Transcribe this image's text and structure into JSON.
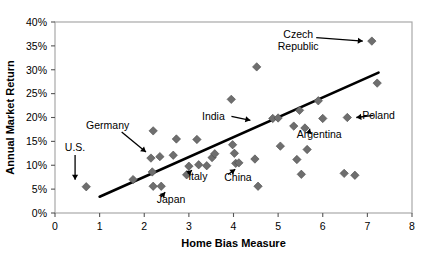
{
  "chart_data": {
    "type": "scatter",
    "title": "",
    "xlabel": "Home Bias Measure",
    "ylabel": "Annual Market Return",
    "xlim": [
      0,
      8
    ],
    "ylim": [
      0,
      40
    ],
    "xticks": [
      "0",
      "1",
      "2",
      "3",
      "4",
      "5",
      "6",
      "7",
      "8"
    ],
    "yticks": [
      "0%",
      "5%",
      "10%",
      "15%",
      "20%",
      "25%",
      "30%",
      "35%",
      "40%"
    ],
    "grid": false,
    "legend": "none",
    "marker": "diamond",
    "marker_color": "#6e6e6e",
    "trendline_color": "#000000",
    "points": [
      {
        "x": 0.7,
        "y": 5.5
      },
      {
        "x": 1.75,
        "y": 7.0
      },
      {
        "x": 2.15,
        "y": 11.5
      },
      {
        "x": 2.2,
        "y": 5.6
      },
      {
        "x": 2.18,
        "y": 8.6
      },
      {
        "x": 2.2,
        "y": 17.2
      },
      {
        "x": 2.35,
        "y": 11.8
      },
      {
        "x": 2.38,
        "y": 5.6
      },
      {
        "x": 2.65,
        "y": 12.1
      },
      {
        "x": 2.72,
        "y": 15.5
      },
      {
        "x": 2.95,
        "y": 8.0
      },
      {
        "x": 3.0,
        "y": 9.8
      },
      {
        "x": 3.18,
        "y": 15.4
      },
      {
        "x": 3.22,
        "y": 10.1
      },
      {
        "x": 3.4,
        "y": 9.9
      },
      {
        "x": 3.52,
        "y": 11.6
      },
      {
        "x": 3.58,
        "y": 12.4
      },
      {
        "x": 3.95,
        "y": 23.8
      },
      {
        "x": 3.98,
        "y": 14.3
      },
      {
        "x": 4.02,
        "y": 12.5
      },
      {
        "x": 4.05,
        "y": 10.4
      },
      {
        "x": 4.12,
        "y": 10.5
      },
      {
        "x": 4.48,
        "y": 11.3
      },
      {
        "x": 4.52,
        "y": 30.6
      },
      {
        "x": 4.55,
        "y": 5.6
      },
      {
        "x": 4.88,
        "y": 19.8
      },
      {
        "x": 5.0,
        "y": 19.9
      },
      {
        "x": 5.05,
        "y": 14.0
      },
      {
        "x": 5.35,
        "y": 18.2
      },
      {
        "x": 5.42,
        "y": 11.2
      },
      {
        "x": 5.48,
        "y": 21.5
      },
      {
        "x": 5.52,
        "y": 8.1
      },
      {
        "x": 5.6,
        "y": 17.8
      },
      {
        "x": 5.65,
        "y": 13.3
      },
      {
        "x": 5.9,
        "y": 23.5
      },
      {
        "x": 6.0,
        "y": 19.8
      },
      {
        "x": 6.48,
        "y": 8.3
      },
      {
        "x": 6.55,
        "y": 20.0
      },
      {
        "x": 6.72,
        "y": 7.9
      },
      {
        "x": 7.1,
        "y": 36.0
      },
      {
        "x": 7.22,
        "y": 27.2
      }
    ],
    "trendline": {
      "x1": 1.0,
      "y1": 3.4,
      "x2": 7.25,
      "y2": 29.4
    },
    "annotations": [
      {
        "label": "U.S.",
        "text_x": 0.45,
        "text_y": 13.0,
        "point_x": 0.7,
        "point_y": 5.5,
        "arrow": "down"
      },
      {
        "label": "Germany",
        "text_x": 1.18,
        "text_y": 17.6,
        "point_x": 2.15,
        "point_y": 11.5,
        "arrow": "diag-down-right"
      },
      {
        "label": "Japan",
        "text_x": 2.6,
        "text_y": 2.1,
        "point_x": 2.38,
        "point_y": 5.6,
        "arrow": "diag-up-left"
      },
      {
        "label": "Italy",
        "text_x": 3.2,
        "text_y": 7.0,
        "point_x": 2.98,
        "point_y": 10.2,
        "arrow": "diag-up-left"
      },
      {
        "label": "China",
        "text_x": 4.1,
        "text_y": 6.8,
        "point_x": 3.95,
        "point_y": 10.4,
        "arrow": "diag-up-left"
      },
      {
        "label": "India",
        "text_x": 3.55,
        "text_y": 19.5,
        "point_x": 4.58,
        "point_y": 19.4,
        "arrow": "right"
      },
      {
        "label": "Argentina",
        "text_x": 5.92,
        "text_y": 15.7,
        "point_x": 5.62,
        "point_y": 18.9,
        "arrow": "diag-up-left"
      },
      {
        "label": "Czech Republic",
        "text_x": 5.45,
        "text_y": 36.0,
        "point_x": 7.1,
        "point_y": 36.0,
        "arrow": "right"
      },
      {
        "label": "Poland",
        "text_x": 7.25,
        "text_y": 19.7,
        "point_x": 6.55,
        "point_y": 20.0,
        "arrow": "left"
      }
    ]
  }
}
